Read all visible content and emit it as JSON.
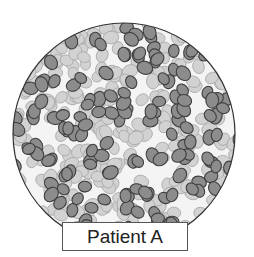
{
  "figure": {
    "label": "Patient A",
    "circle": {
      "cx": 124,
      "cy": 134,
      "r": 111,
      "stroke": "#333333"
    },
    "colors": {
      "dark_cell_fill": "#8c8c8c",
      "dark_cell_stroke": "#3f3f3f",
      "light_cell_fill": "#d2d2d2",
      "light_cell_stroke": "#a8a8a8",
      "background": "#f4f4f4"
    },
    "cell_size": {
      "rx": 7,
      "ry": 5.6
    },
    "cell_counts": {
      "light": 260,
      "dark": 150
    },
    "seed": 7
  }
}
